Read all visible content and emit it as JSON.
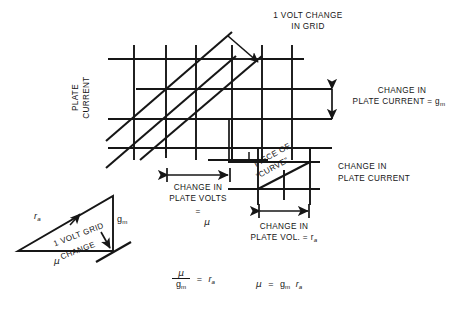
{
  "figure": {
    "title_note": "Vacuum tube characteristic curves grid illustrating mu, gm and ra",
    "axis": {
      "y_label_line1": "PLATE",
      "y_label_line2": "CURRENT"
    },
    "callouts": {
      "grid_change": {
        "line1": "1 VOLT CHANGE",
        "line2": "IN GRID"
      },
      "plate_current_gm": {
        "line1": "CHANGE IN",
        "line2_pre": "PLATE CURRENT = g",
        "line2_sub": "m"
      },
      "plate_current": {
        "line1": "CHANGE IN",
        "line2": "PLATE CURRENT"
      },
      "plate_volts_mu": {
        "line1": "CHANGE IN",
        "line2": "PLATE VOLTS",
        "line3_eq": "=",
        "line3_sym": "μ"
      },
      "plate_vol_ra": {
        "line1": "CHANGE IN",
        "line2_pre": "PLATE VOL. = r",
        "line2_sub": "a"
      },
      "piece_of_curve": {
        "line1": "PIECE OF",
        "line2": "“CURVE”"
      }
    },
    "triangle": {
      "hyp_label_pre": "r",
      "hyp_label_sub": "a",
      "vert_label_pre": "g",
      "vert_label_sub": "m",
      "base_label": "μ",
      "inner_line1": "1 VOLT GRID",
      "inner_line2": "CHANGE"
    },
    "equations": {
      "eq1_num": "μ",
      "eq1_den_pre": "g",
      "eq1_den_sub": "m",
      "eq1_equals": "=",
      "eq1_rhs_pre": "r",
      "eq1_rhs_sub": "a",
      "eq2_lhs": "μ",
      "eq2_equals": "=",
      "eq2_rhs1_pre": "g",
      "eq2_rhs1_sub": "m",
      "eq2_rhs2_pre": "r",
      "eq2_rhs2_sub": "a"
    },
    "style": {
      "ink": "#161616",
      "paper": "#ffffff"
    }
  }
}
